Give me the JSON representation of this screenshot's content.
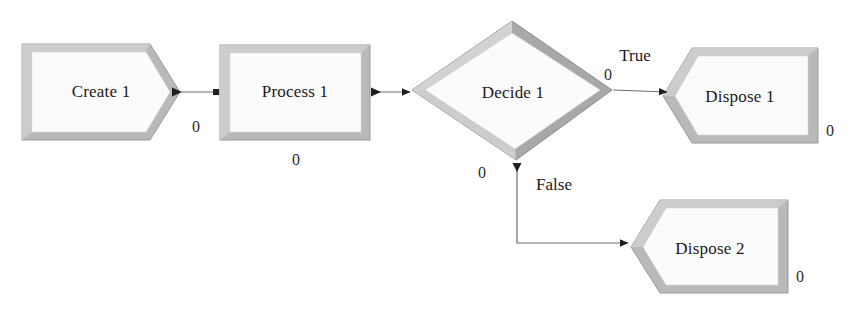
{
  "diagram": {
    "background_color": "#ffffff",
    "fill_color": "#fbfbfb",
    "shadow_light": "#c9c9c9",
    "shadow_dark": "#8e8e8e",
    "connector_color": "#6e6e6e",
    "text_color": "#1a1a1a",
    "nodes": [
      {
        "id": "create-1",
        "label": "Create 1",
        "shape": "pentagon-right-point",
        "counter": "0"
      },
      {
        "id": "process-1",
        "label": "Process 1",
        "shape": "rectangle",
        "counter": "0"
      },
      {
        "id": "decide-1",
        "label": "Decide 1",
        "shape": "diamond",
        "counter_true": "0",
        "counter_false": "0"
      },
      {
        "id": "dispose-1",
        "label": "Dispose 1",
        "shape": "pentagon-left-notch",
        "counter": "0"
      },
      {
        "id": "dispose-2",
        "label": "Dispose 2",
        "shape": "pentagon-left-notch",
        "counter": "0"
      }
    ],
    "connectors": [
      {
        "id": "create-to-process",
        "from": "create-1",
        "to": "process-1",
        "label": ""
      },
      {
        "id": "process-to-decide",
        "from": "process-1",
        "to": "decide-1",
        "label": ""
      },
      {
        "id": "decide-true-to-dispose-1",
        "from": "decide-1",
        "to": "dispose-1",
        "label": "True"
      },
      {
        "id": "decide-false-to-dispose-2",
        "from": "decide-1",
        "to": "dispose-2",
        "label": "False"
      }
    ]
  }
}
